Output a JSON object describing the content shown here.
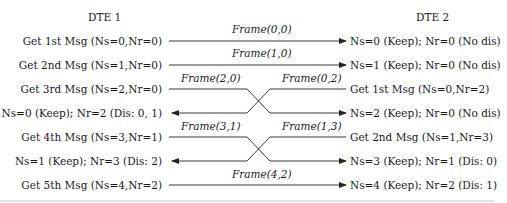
{
  "headers": {
    "dte1": "DTE 1",
    "dte2": "DTE 2"
  },
  "left_rows": [
    "Get 1st Msg (Ns=0,Nr=0)",
    "Get 2nd Msg (Ns=1,Nr=0)",
    "Get 3rd Msg (Ns=2,Nr=0)",
    "Ns=0 (Keep); Nr=2 (Dis: 0, 1)",
    "Get 4th Msg (Ns=3,Nr=1)",
    "Ns=1 (Keep); Nr=3 (Dis: 2)",
    "Get 5th Msg (Ns=4,Nr=2)"
  ],
  "right_rows": [
    "Ns=0 (Keep); Nr=0 (No dis)",
    "Ns=1 (Keep); Nr=0 (No dis)",
    "Get 1st Msg (Ns=0,Nr=2)",
    "Ns=2 (Keep); Nr=0 (No dis)",
    "Get 2nd Msg (Ns=1,Nr=3)",
    "Ns=3 (Keep); Nr=1 (Dis: 0)",
    "Ns=4 (Keep); Nr=2 (Dis: 1)"
  ],
  "frames": {
    "f00": "Frame(0,0)",
    "f10": "Frame(1,0)",
    "f20": "Frame(2,0)",
    "f02": "Frame(0,2)",
    "f31": "Frame(3,1)",
    "f13": "Frame(1,3)",
    "f42": "Frame(4,2)"
  },
  "colors": {
    "line": "#222222",
    "text": "#1a1a1a",
    "rule": "#9a9a9a"
  }
}
